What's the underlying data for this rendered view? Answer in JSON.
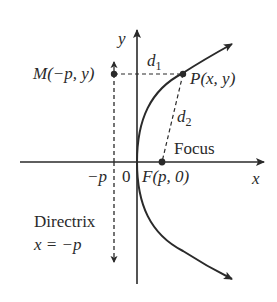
{
  "diagram": {
    "type": "parabola-focus-directrix",
    "colors": {
      "ink": "#2a2a2a",
      "background": "#ffffff"
    },
    "axes": {
      "x_label": "x",
      "y_label": "y",
      "origin_label": "0"
    },
    "ticks": {
      "neg_p": "−p"
    },
    "points": {
      "M": {
        "label_name": "M",
        "label_coords": "(−p, y)"
      },
      "P": {
        "label_name": "P",
        "label_coords": "(x, y)"
      },
      "F": {
        "label_name": "F",
        "label_coords": "(p, 0)"
      }
    },
    "distances": {
      "d1_base": "d",
      "d1_sub": "1",
      "d2_base": "d",
      "d2_sub": "2"
    },
    "annotations": {
      "focus": "Focus",
      "directrix": "Directrix",
      "directrix_eq_var": "x",
      "directrix_eq_rest": " = −p"
    }
  }
}
